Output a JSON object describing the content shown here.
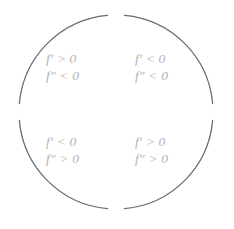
{
  "figure": {
    "background_color": "#ffffff",
    "arc_color": "#6b6b6b",
    "text_color": "#b3b3b3"
  },
  "circle": {
    "center_x": 116,
    "center_y": 112,
    "radius": 97,
    "stroke_width": 1.3,
    "arcs": [
      {
        "name": "top-left-arc",
        "start_deg": 185,
        "end_deg": 265
      },
      {
        "name": "top-right-arc",
        "start_deg": 275,
        "end_deg": 355
      },
      {
        "name": "bottom-right-arc",
        "start_deg": 5,
        "end_deg": 85
      },
      {
        "name": "bottom-left-arc",
        "start_deg": 95,
        "end_deg": 175
      }
    ]
  },
  "quadrants": [
    {
      "id": "top-left",
      "first_derivative": "f′ > 0",
      "second_derivative": "f″ < 0",
      "fn": "f",
      "prime1": "′",
      "prime2": "″",
      "rel1": ">",
      "rel2": "<",
      "num": "0"
    },
    {
      "id": "top-right",
      "first_derivative": "f′ < 0",
      "second_derivative": "f″ < 0",
      "fn": "f",
      "prime1": "′",
      "prime2": "″",
      "rel1": "<",
      "rel2": "<",
      "num": "0"
    },
    {
      "id": "bottom-left",
      "first_derivative": "f′ < 0",
      "second_derivative": "f″ > 0",
      "fn": "f",
      "prime1": "′",
      "prime2": "″",
      "rel1": "<",
      "rel2": ">",
      "num": "0"
    },
    {
      "id": "bottom-right",
      "first_derivative": "f′ > 0",
      "second_derivative": "f″ > 0",
      "fn": "f",
      "prime1": "′",
      "prime2": "″",
      "rel1": ">",
      "rel2": ">",
      "num": "0"
    }
  ]
}
